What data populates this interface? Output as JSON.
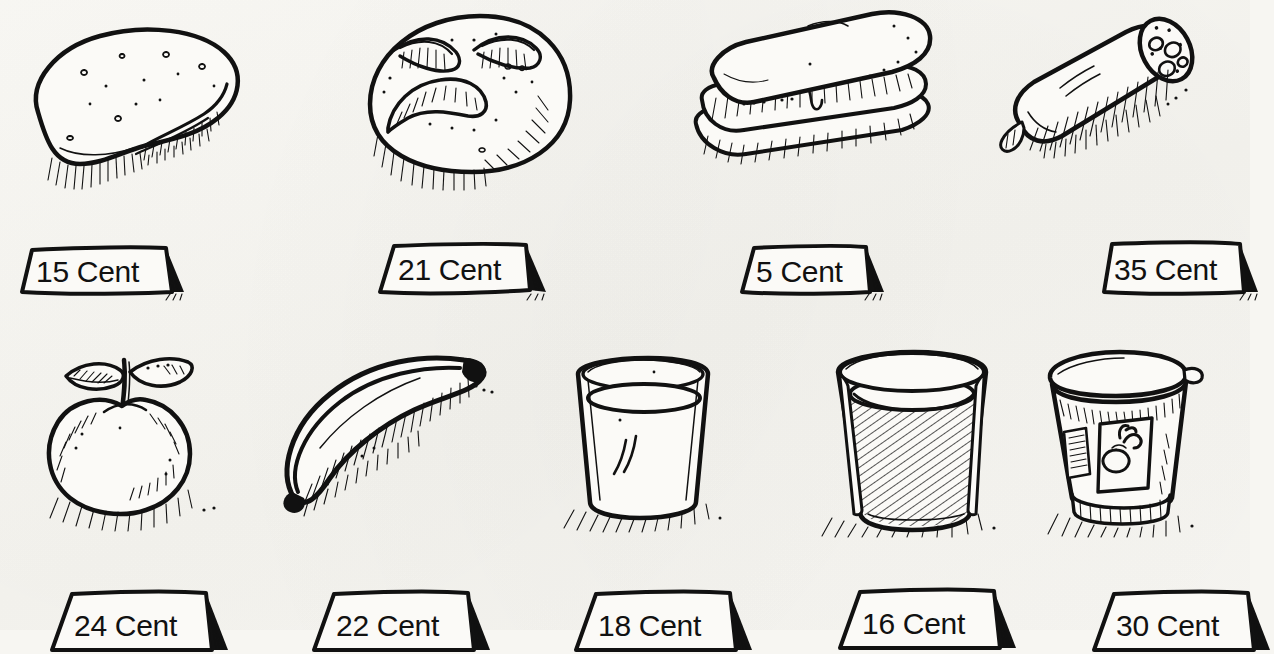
{
  "sheet": {
    "title": "Food items with price tags worksheet",
    "background_color": "#f7f6f2",
    "ink_color": "#111111",
    "currency_word": "Cent"
  },
  "rows": [
    {
      "name": "top-row",
      "items": [
        {
          "id": "bread-roll",
          "label": "bread roll",
          "icon": "bread-roll-icon",
          "price": "15 Cent"
        },
        {
          "id": "round-roll",
          "label": "round bread roll",
          "icon": "round-bread-roll-icon",
          "price": "21 Cent"
        },
        {
          "id": "sandwich",
          "label": "sandwich",
          "icon": "sandwich-icon",
          "price": "5 Cent"
        },
        {
          "id": "salami",
          "label": "salami sausage",
          "icon": "salami-icon",
          "price": "35 Cent"
        }
      ]
    },
    {
      "name": "bottom-row",
      "items": [
        {
          "id": "apple",
          "label": "apple",
          "icon": "apple-icon",
          "price": "24 Cent"
        },
        {
          "id": "banana",
          "label": "banana",
          "icon": "banana-icon",
          "price": "22 Cent"
        },
        {
          "id": "milk-glass",
          "label": "glass of milk",
          "icon": "milk-glass-icon",
          "price": "18 Cent"
        },
        {
          "id": "juice-glass",
          "label": "glass of juice",
          "icon": "juice-glass-icon",
          "price": "16 Cent"
        },
        {
          "id": "yogurt-cup",
          "label": "yogurt cup",
          "icon": "yogurt-cup-icon",
          "price": "30 Cent"
        }
      ]
    }
  ],
  "prices": {
    "bread_roll": "15 Cent",
    "round_roll": "21 Cent",
    "sandwich": "5 Cent",
    "salami": "35 Cent",
    "apple": "24 Cent",
    "banana": "22 Cent",
    "milk_glass": "18 Cent",
    "juice_glass": "16 Cent",
    "yogurt_cup": "30 Cent"
  }
}
